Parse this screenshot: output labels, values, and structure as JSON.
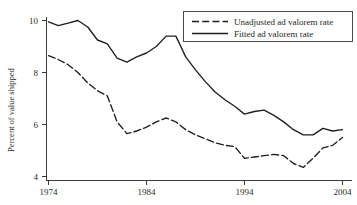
{
  "chart_data": {
    "type": "line",
    "title": "",
    "subtitle": "",
    "xlabel": "",
    "ylabel": "Percent of value shipped",
    "xlim": [
      1974,
      2004
    ],
    "ylim": [
      3.6,
      10.35
    ],
    "grid": false,
    "legend_position": "top-right",
    "x_ticks": [
      1974,
      1984,
      1994,
      2004
    ],
    "x_tick_labels": [
      "1974",
      "1984",
      "1994",
      "2004"
    ],
    "y_ticks": [
      4,
      6,
      8,
      10
    ],
    "y_tick_labels": [
      "4",
      "6",
      "8",
      "10"
    ],
    "x": [
      1974,
      1975,
      1976,
      1977,
      1978,
      1979,
      1980,
      1981,
      1982,
      1983,
      1984,
      1985,
      1986,
      1987,
      1988,
      1989,
      1990,
      1991,
      1992,
      1993,
      1994,
      1995,
      1996,
      1997,
      1998,
      1999,
      2000,
      2001,
      2002,
      2003,
      2004
    ],
    "series": [
      {
        "name": "Unadjusted ad valorem rate",
        "style": "dashed",
        "color": "#1f1f1f",
        "values": [
          8.65,
          8.5,
          8.3,
          8.0,
          7.6,
          7.3,
          7.1,
          6.1,
          5.65,
          5.75,
          5.9,
          6.1,
          6.25,
          6.1,
          5.8,
          5.6,
          5.45,
          5.3,
          5.2,
          5.15,
          4.7,
          4.75,
          4.8,
          4.85,
          4.8,
          4.5,
          4.35,
          4.7,
          5.1,
          5.2,
          5.5
        ]
      },
      {
        "name": "Fitted ad valorem rate",
        "style": "solid",
        "color": "#1f1f1f",
        "values": [
          9.95,
          9.8,
          9.9,
          10.0,
          9.75,
          9.25,
          9.1,
          8.55,
          8.4,
          8.6,
          8.75,
          9.0,
          9.4,
          9.4,
          8.6,
          8.1,
          7.65,
          7.25,
          6.95,
          6.7,
          6.4,
          6.5,
          6.55,
          6.35,
          6.1,
          5.8,
          5.6,
          5.6,
          5.85,
          5.75,
          5.8
        ]
      }
    ]
  },
  "legend": {
    "entries": [
      {
        "label": "Unadjusted ad valorem rate"
      },
      {
        "label": "Fitted ad valorem rate"
      }
    ]
  },
  "axes": {
    "y_axis_title": "Percent of value shipped"
  }
}
